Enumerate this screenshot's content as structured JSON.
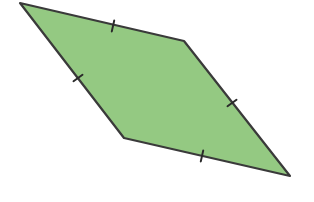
{
  "diagram": {
    "shape": "rhombus",
    "fill_color": "#94c982",
    "stroke_color": "#3a3a3a",
    "stroke_width": 2.2,
    "vertices": [
      {
        "name": "top-left",
        "x": 20,
        "y": 3
      },
      {
        "name": "top-right",
        "x": 184,
        "y": 41
      },
      {
        "name": "bottom-right",
        "x": 290,
        "y": 176
      },
      {
        "name": "bottom-left",
        "x": 124,
        "y": 138
      }
    ],
    "tick_marks": [
      {
        "side": "top",
        "x": 113,
        "y": 26,
        "angle": 103
      },
      {
        "side": "left",
        "x": 78,
        "y": 78,
        "angle": 145
      },
      {
        "side": "right",
        "x": 232,
        "y": 103,
        "angle": 145
      },
      {
        "side": "bottom",
        "x": 202,
        "y": 156,
        "angle": 103
      }
    ],
    "tick_length": 11,
    "tick_color": "#2a2a2a"
  }
}
